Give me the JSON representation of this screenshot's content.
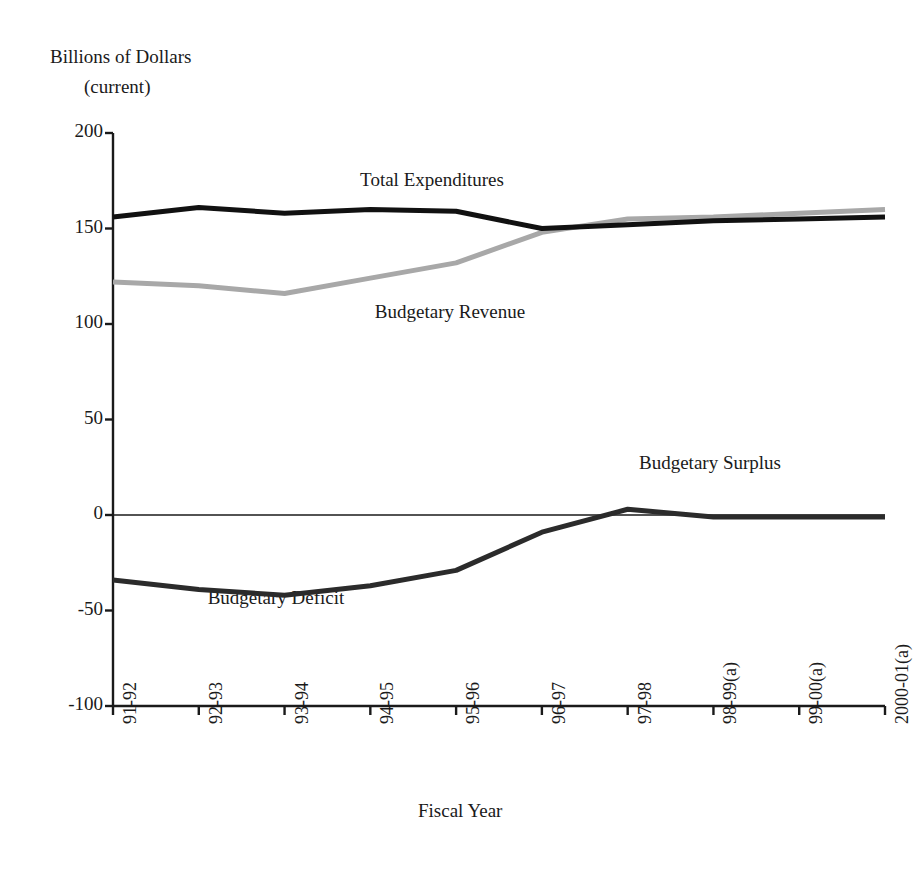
{
  "chart_data": {
    "type": "line",
    "title": "Billions of Dollars",
    "subtitle": "(current)",
    "xlabel": "Fiscal Year",
    "ylabel": "Billions of Dollars (current)",
    "grid": false,
    "legend_position": "inline-annotations",
    "ylim": [
      -100,
      200
    ],
    "yticks": [
      "200",
      "150",
      "100",
      "50",
      "0",
      "-50",
      "-100"
    ],
    "ytick_values": [
      200,
      150,
      100,
      50,
      0,
      -50,
      -100
    ],
    "categories": [
      "91-92",
      "92-93",
      "93-94",
      "94-95",
      "95-96",
      "96-97",
      "97-98",
      "98-99(a)",
      "99-00(a)",
      "2000-01(a)"
    ],
    "series": [
      {
        "name": "Total Expenditures",
        "color": "#111111",
        "values": [
          156,
          161,
          158,
          160,
          159,
          150,
          152,
          154,
          155,
          156
        ]
      },
      {
        "name": "Budgetary Revenue",
        "color": "#a8a8a8",
        "values": [
          122,
          120,
          116,
          124,
          132,
          148,
          155,
          156,
          158,
          160
        ]
      },
      {
        "name": "Budgetary Balance",
        "color": "#2b2b2b",
        "values": [
          -34,
          -39,
          -42,
          -37,
          -29,
          -9,
          3,
          -1,
          -1,
          -1
        ],
        "annotations": [
          {
            "text": "Budgetary Deficit",
            "at": "93-94"
          },
          {
            "text": "Budgetary Surplus",
            "at": "98-99(a)"
          }
        ]
      }
    ],
    "annotations": [
      {
        "text": "Total Expenditures",
        "x": 432,
        "y": 180
      },
      {
        "text": "Budgetary Revenue",
        "x": 450,
        "y": 312
      },
      {
        "text": "Budgetary Surplus",
        "x": 710,
        "y": 463
      },
      {
        "text": "Budgetary Deficit",
        "x": 276,
        "y": 598
      }
    ]
  },
  "axes": {
    "y_title_line1": "Billions of Dollars",
    "y_title_line2": "(current)",
    "x_title": "Fiscal Year"
  }
}
